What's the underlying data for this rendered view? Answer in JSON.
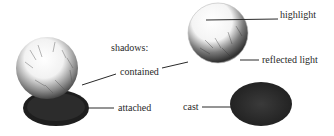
{
  "diagram": {
    "heading": "shadows:",
    "labels": {
      "contained": "contained",
      "attached": "attached",
      "highlight": "highlight",
      "reflected_light": "reflected light",
      "cast": "cast"
    },
    "colors": {
      "background": "#ffffff",
      "ink": "#2a2a2a",
      "shadow_dark": "#1e1e1e",
      "shadow_mid": "#3c3c3c"
    }
  }
}
